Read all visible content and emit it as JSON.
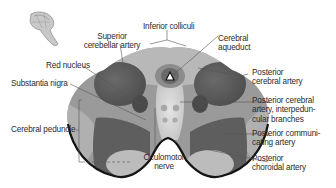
{
  "diagram": {
    "palette": {
      "background": "#ffffff",
      "outline": "#1a1a1a",
      "dark_region": "#5a5a5a",
      "mid_region": "#8a8a8a",
      "light_region": "#b4b4b4",
      "pale_region": "#d6d6d6",
      "label_text": "#2b2b2b",
      "leader_line": "#555555"
    },
    "labels": {
      "superior_cerebellar_artery": "Superior\ncerebellar artery",
      "inferior_colliculi": "Inferior colliculi",
      "cerebral_aqueduct": "Cerebral\naqueduct",
      "red_nucleus": "Red nucleus",
      "posterior_cerebral_artery": "Posterior\ncerebral artery",
      "substantia_nigra": "Substantia nigra",
      "pca_interpeduncular_branches": "Posterior cerebral\nartery, interpedun-\ncular branches",
      "cerebral_peduncle": "Cerebral peduncle",
      "posterior_communicating_artery": "Posterior communi-\ncating artery",
      "oculomotor_nerve": "Oculomotor\nnerve",
      "posterior_choroidal_artery": "Posterior\nchoroidal artery"
    },
    "orientation_icon": "brainstem-thumbnail-icon"
  }
}
